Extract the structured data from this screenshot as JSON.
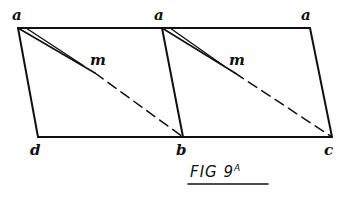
{
  "figure": {
    "caption_main": "FIG 9",
    "caption_sup": "A",
    "labels": {
      "a_left": "a",
      "a_mid": "a",
      "a_right": "a",
      "m_left": "m",
      "m_right": "m",
      "d": "d",
      "b": "b",
      "c": "c"
    },
    "stroke_color": "#111111",
    "background": "#ffffff"
  }
}
